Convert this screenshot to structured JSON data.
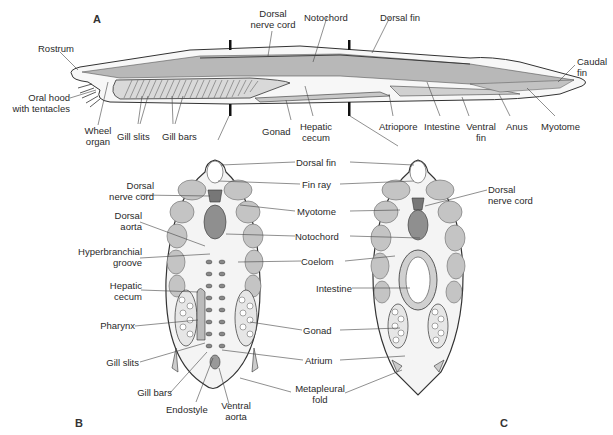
{
  "figure": {
    "colors": {
      "outline": "#333333",
      "tissue_light": "#c9c9c9",
      "tissue_mid": "#b3b3b3",
      "notochord": "#8f8f8f",
      "background": "#ffffff",
      "label_text": "#2a2a2a"
    },
    "panels": [
      {
        "id": "A",
        "letter": "A",
        "view": "longitudinal lateral view"
      },
      {
        "id": "B",
        "letter": "B",
        "view": "cross-section through pharynx"
      },
      {
        "id": "C",
        "letter": "C",
        "view": "cross-section through intestine"
      }
    ],
    "panel_a_labels": {
      "rostrum": "Rostrum",
      "oral_hood_1": "Oral hood",
      "oral_hood_2": "with tentacles",
      "wheel_organ_1": "Wheel",
      "wheel_organ_2": "organ",
      "gill_slits": "Gill slits",
      "gill_bars": "Gill bars",
      "dorsal_nerve_cord_1": "Dorsal",
      "dorsal_nerve_cord_2": "nerve cord",
      "notochord": "Notochord",
      "dorsal_fin": "Dorsal fin",
      "gonad": "Gonad",
      "hepatic_cecum_1": "Hepatic",
      "hepatic_cecum_2": "cecum",
      "atriopore": "Atriopore",
      "intestine": "Intestine",
      "ventral_fin_1": "Ventral",
      "ventral_fin_2": "fin",
      "anus": "Anus",
      "myotome": "Myotome",
      "caudal_fin_1": "Caudal",
      "caudal_fin_2": "fin"
    },
    "panel_b_labels": {
      "dorsal_nerve_cord_1": "Dorsal",
      "dorsal_nerve_cord_2": "nerve cord",
      "dorsal_aorta_1": "Dorsal",
      "dorsal_aorta_2": "aorta",
      "hyperbranchial_1": "Hyperbranchial",
      "hyperbranchial_2": "groove",
      "hepatic_cecum_1": "Hepatic",
      "hepatic_cecum_2": "cecum",
      "pharynx": "Pharynx",
      "gill_slits": "Gill slits",
      "gill_bars": "Gill bars",
      "endostyle": "Endostyle",
      "ventral_aorta_1": "Ventral",
      "ventral_aorta_2": "aorta"
    },
    "shared_labels": {
      "dorsal_fin": "Dorsal fin",
      "fin_ray": "Fin ray",
      "myotome": "Myotome",
      "notochord": "Notochord",
      "coelom": "Coelom",
      "intestine": "Intestine",
      "gonad": "Gonad",
      "atrium": "Atrium",
      "metapleural_1": "Metapleural",
      "metapleural_2": "fold"
    },
    "panel_c_labels": {
      "dorsal_nerve_cord_1": "Dorsal",
      "dorsal_nerve_cord_2": "nerve cord"
    }
  }
}
